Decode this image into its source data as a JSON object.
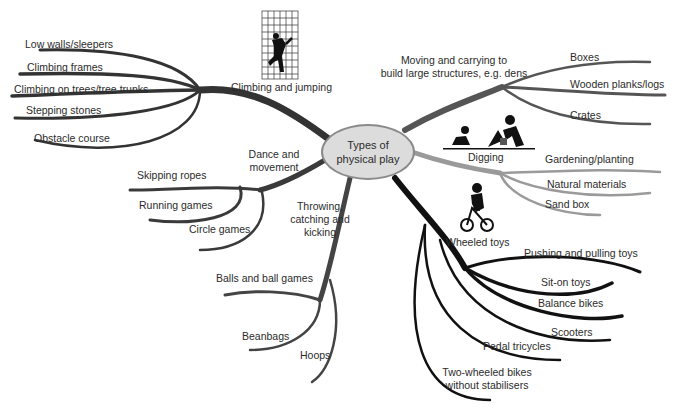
{
  "diagram": {
    "type": "mind-map",
    "center": {
      "label": "Types of physical play",
      "fill": "#dcdcdc",
      "stroke": "#8a8a8a"
    },
    "branches": [
      {
        "label": "Climbing and jumping",
        "icon": "climbing-wall-icon",
        "color": "#333333",
        "children": [
          "Low walls/sleepers",
          "Climbing frames",
          "Climbing on trees/tree trunks",
          "Stepping stones",
          "Obstacle course"
        ]
      },
      {
        "label": "Moving and carrying to build large structures, e.g. dens",
        "label_line1": "Moving and carrying to",
        "label_line2": "build large structures, e.g. dens",
        "color": "#555555",
        "children": [
          "Boxes",
          "Wooden planks/logs",
          "Crates"
        ]
      },
      {
        "label": "Digging",
        "icon": "digging-icon",
        "color": "#9a9a9a",
        "children": [
          "Gardening/planting",
          "Natural materials",
          "Sand box"
        ]
      },
      {
        "label": "Wheeled toys",
        "icon": "bicycle-icon",
        "color": "#111111",
        "children": [
          "Pushing and pulling toys",
          "Sit-on toys",
          "Balance bikes",
          "Scooters",
          "Pedal tricycles",
          "Two-wheeled bikes without stabilisers"
        ],
        "child_last_line1": "Two-wheeled bikes",
        "child_last_line2": "without stabilisers"
      },
      {
        "label": "Throwing, catching and kicking",
        "label_line1": "Throwing,",
        "label_line2": "catching and",
        "label_line3": "kicking",
        "color": "#444444",
        "children": [
          "Balls and ball games",
          "Beanbags",
          "Hoops"
        ]
      },
      {
        "label": "Dance and movement",
        "label_line1": "Dance and",
        "label_line2": "movement",
        "color": "#3a3a3a",
        "children": [
          "Skipping ropes",
          "Running games",
          "Circle games"
        ]
      }
    ]
  }
}
